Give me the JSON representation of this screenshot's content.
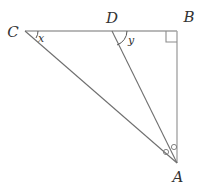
{
  "figure": {
    "background_color": "#ffffff",
    "width": 204,
    "height": 190,
    "colors": {
      "top_segment": "#a0a0a0",
      "vertical_segment": "#a6a6a6",
      "diagonal_segment": "#6f6f6f",
      "label_text": "#333333",
      "mark": "#777777"
    },
    "vertices": [
      {
        "id": "C",
        "label": "C",
        "x": 25,
        "y": 31,
        "label_x": 13,
        "label_y": 37
      },
      {
        "id": "D",
        "label": "D",
        "x": 112,
        "y": 31,
        "label_x": 112,
        "label_y": 23
      },
      {
        "id": "B",
        "label": "B",
        "x": 177,
        "y": 31,
        "label_x": 189,
        "label_y": 22
      },
      {
        "id": "A",
        "label": "A",
        "x": 177,
        "y": 163,
        "label_x": 178,
        "label_y": 181
      }
    ],
    "segments": [
      {
        "id": "CB",
        "from": "C",
        "to": "B",
        "style": "top"
      },
      {
        "id": "BA",
        "from": "B",
        "to": "A",
        "style": "vertical"
      },
      {
        "id": "CA",
        "from": "C",
        "to": "A",
        "style": "diagonal"
      },
      {
        "id": "DA",
        "from": "D",
        "to": "A",
        "style": "diagonal"
      }
    ],
    "angle_labels": [
      {
        "id": "x",
        "label": "x",
        "at_vertex": "C",
        "label_x": 41,
        "label_y": 41
      },
      {
        "id": "y",
        "label": "y",
        "at_vertex": "D",
        "label_x": 131,
        "label_y": 43
      }
    ],
    "marks": [
      {
        "id": "right-angle-B",
        "type": "right-angle",
        "at_vertex": "B"
      },
      {
        "id": "angle-arc-C",
        "type": "arc",
        "at_vertex": "C"
      },
      {
        "id": "angle-arc-D",
        "type": "arc",
        "at_vertex": "D"
      },
      {
        "id": "congruent-angle-CAD",
        "type": "circle-dot",
        "at_vertex": "A",
        "cx": 166,
        "cy": 152
      },
      {
        "id": "congruent-angle-DAB",
        "type": "circle-dot",
        "at_vertex": "A",
        "cx": 174,
        "cy": 148
      }
    ]
  }
}
